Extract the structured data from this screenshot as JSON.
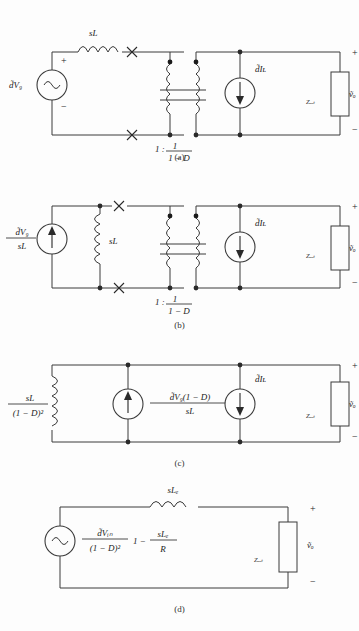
{
  "figure": {
    "panels": [
      {
        "id": "a",
        "caption": "(a)",
        "source_label": "d̃V₉",
        "source_type": "ac-voltage-source",
        "series_inductor_label": "sL",
        "transformer_ratio_left": "1 :",
        "transformer_ratio_num": "1",
        "transformer_ratio_den": "1 − D",
        "current_source_label": "d̃Iʟ",
        "load_label": "Zₒᵤₜ",
        "output_label": "ṽₒ",
        "plus": "+",
        "minus": "−",
        "switch_marks": 2
      },
      {
        "id": "b",
        "caption": "(b)",
        "source_num": "d̃V₉",
        "source_den": "sL",
        "source_type": "dc-current-source",
        "shunt_inductor_label": "sL",
        "transformer_ratio_left": "1 :",
        "transformer_ratio_num": "1",
        "transformer_ratio_den": "1 − D",
        "current_source_label": "d̃Iʟ",
        "load_label": "Zₒᵤₜ",
        "output_label": "ṽₒ",
        "plus": "+",
        "minus": "−",
        "switch_marks": 2
      },
      {
        "id": "c",
        "caption": "(c)",
        "inductor_num": "sL",
        "inductor_den": "(1 − D)²",
        "source1_num": "d̃V₉(1 − D)",
        "source1_den": "sL",
        "source1_type": "current-source-up",
        "source2_label": "d̃Iʟ",
        "source2_type": "current-source-down",
        "load_label": "Zₒᵤₜ",
        "output_label": "ṽₒ",
        "plus": "+",
        "minus": "−"
      },
      {
        "id": "d",
        "caption": "(d)",
        "source_type": "ac-voltage-source",
        "source_num": "d̃Vᵢₙ",
        "source_den": "(1 − D)²",
        "source_factor_pre": "1 −",
        "source_factor_num": "sLₑ",
        "source_factor_den": "R",
        "series_inductor_label": "sLₑ",
        "load_label": "Zₒᵤₜ",
        "output_label": "ṽₒ",
        "plus": "+",
        "minus": "−"
      }
    ]
  },
  "colors": {
    "wire": "#3a3a3a",
    "text": "#222222",
    "background": "#fdfdfd",
    "node": "#2a2a2a"
  }
}
